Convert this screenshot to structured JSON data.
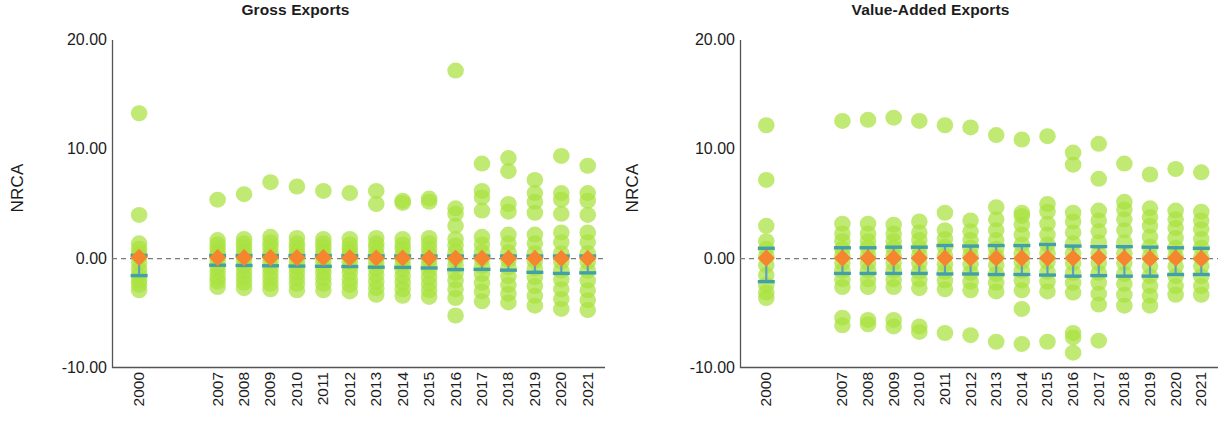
{
  "figure": {
    "width": 1230,
    "height": 434,
    "background": "#ffffff"
  },
  "style": {
    "dot_color": "#a7e23f",
    "mean_color": "#f5852f",
    "error_color": "#5a9ec9",
    "error_cap_color": "#43a0a8",
    "zeroline_color": "#7a7a7a",
    "axis_color": "#555555",
    "text_color": "#1c1c1c"
  },
  "chart_data": [
    {
      "panel": "left",
      "type": "scatter",
      "title": "Gross Exports",
      "xlabel": "",
      "ylabel": "NRCA",
      "ylim": [
        -10,
        20
      ],
      "yticks": [
        20,
        10,
        0,
        -10
      ],
      "ytick_labels": [
        "20.00",
        "10.00",
        "0.00",
        "-10.00"
      ],
      "grid": false,
      "legend": "none",
      "zero_reference_line": 0.0,
      "categories": [
        "2000",
        "2007",
        "2008",
        "2009",
        "2010",
        "2011",
        "2012",
        "2013",
        "2014",
        "2015",
        "2016",
        "2017",
        "2018",
        "2019",
        "2020",
        "2021"
      ],
      "series": [
        {
          "name": "Mean NRCA",
          "marker": "diamond",
          "values": [
            0.12,
            0.1,
            0.1,
            0.1,
            0.1,
            0.1,
            0.08,
            0.06,
            0.06,
            0.05,
            0.04,
            0.03,
            0.02,
            0.02,
            0.02,
            0.02
          ]
        },
        {
          "name": "95% Confidence Interval",
          "marker": "errorbar",
          "lower": [
            -1.55,
            -0.6,
            -0.62,
            -0.65,
            -0.68,
            -0.7,
            -0.72,
            -0.78,
            -0.8,
            -0.85,
            -1.0,
            -0.98,
            -1.05,
            -1.25,
            -1.35,
            -1.3
          ],
          "upper": [
            0.3,
            0.28,
            0.28,
            0.28,
            0.28,
            0.28,
            0.26,
            0.25,
            0.24,
            0.24,
            0.24,
            0.24,
            0.24,
            0.24,
            0.24,
            0.24
          ]
        }
      ],
      "scatter_points": {
        "2000": [
          13.3,
          4.0,
          1.4,
          0.9,
          0.5,
          0.2,
          -0.4,
          -1.0,
          -1.5,
          -2.0,
          -2.4,
          -2.9
        ],
        "2007": [
          5.4,
          1.7,
          1.3,
          0.9,
          0.5,
          0.2,
          -0.2,
          -0.7,
          -1.2,
          -1.7,
          -2.1,
          -2.6
        ],
        "2008": [
          5.9,
          1.8,
          1.4,
          1.0,
          0.6,
          0.2,
          -0.2,
          -0.7,
          -1.2,
          -1.7,
          -2.2,
          -2.7
        ],
        "2009": [
          7.0,
          2.0,
          1.5,
          1.1,
          0.6,
          0.2,
          -0.3,
          -0.8,
          -1.3,
          -1.8,
          -2.3,
          -2.8
        ],
        "2010": [
          6.6,
          1.9,
          1.4,
          1.0,
          0.6,
          0.2,
          -0.3,
          -0.8,
          -1.3,
          -1.8,
          -2.3,
          -2.9
        ],
        "2011": [
          6.2,
          1.8,
          1.4,
          1.0,
          0.6,
          0.2,
          -0.3,
          -0.8,
          -1.3,
          -1.8,
          -2.3,
          -2.9
        ],
        "2012": [
          6.0,
          1.8,
          1.3,
          0.9,
          0.5,
          0.2,
          -0.3,
          -0.8,
          -1.3,
          -1.9,
          -2.4,
          -3.0
        ],
        "2013": [
          6.2,
          5.0,
          1.9,
          1.4,
          1.0,
          0.5,
          0.1,
          -0.4,
          -0.9,
          -1.5,
          -2.1,
          -2.7,
          -3.3
        ],
        "2014": [
          5.3,
          5.1,
          1.8,
          1.3,
          0.9,
          0.4,
          0.0,
          -0.5,
          -1.0,
          -1.6,
          -2.2,
          -2.8,
          -3.4
        ],
        "2015": [
          5.5,
          5.2,
          1.9,
          1.4,
          0.9,
          0.4,
          -0.1,
          -0.6,
          -1.1,
          -1.7,
          -2.3,
          -2.9,
          -3.5
        ],
        "2016": [
          17.2,
          4.6,
          4.1,
          3.0,
          1.8,
          1.2,
          0.6,
          0.0,
          -0.6,
          -1.3,
          -2.0,
          -2.8,
          -3.6,
          -5.2
        ],
        "2017": [
          8.7,
          6.2,
          5.6,
          4.4,
          2.0,
          1.3,
          0.6,
          0.0,
          -0.7,
          -1.4,
          -2.2,
          -3.0,
          -3.9
        ],
        "2018": [
          9.2,
          8.0,
          5.0,
          4.3,
          2.2,
          1.4,
          0.6,
          -0.1,
          -0.8,
          -1.6,
          -2.4,
          -3.2,
          -4.0
        ],
        "2019": [
          7.2,
          6.0,
          5.2,
          4.2,
          2.2,
          1.4,
          0.5,
          -0.2,
          -0.9,
          -1.7,
          -2.5,
          -3.4,
          -4.3
        ],
        "2020": [
          9.4,
          6.0,
          5.4,
          4.1,
          2.4,
          1.5,
          0.5,
          -0.3,
          -1.1,
          -1.9,
          -2.8,
          -3.7,
          -4.6
        ],
        "2021": [
          8.5,
          6.0,
          5.3,
          4.0,
          2.4,
          1.5,
          0.5,
          -0.3,
          -1.1,
          -2.0,
          -2.9,
          -3.8,
          -4.7
        ]
      }
    },
    {
      "panel": "right",
      "type": "scatter",
      "title": "Value-Added Exports",
      "xlabel": "",
      "ylabel": "NRCA",
      "ylim": [
        -10,
        20
      ],
      "yticks": [
        20,
        10,
        0,
        -10
      ],
      "ytick_labels": [
        "20.00",
        "10.00",
        "0.00",
        "-10.00"
      ],
      "grid": false,
      "legend": "none",
      "zero_reference_line": 0.0,
      "categories": [
        "2000",
        "2007",
        "2008",
        "2009",
        "2010",
        "2011",
        "2012",
        "2013",
        "2014",
        "2015",
        "2016",
        "2017",
        "2018",
        "2019",
        "2020",
        "2021"
      ],
      "series": [
        {
          "name": "Mean NRCA",
          "marker": "diamond",
          "values": [
            0.05,
            0.05,
            0.05,
            0.05,
            0.05,
            0.05,
            0.05,
            0.05,
            0.05,
            0.05,
            0.05,
            0.1,
            0.05,
            0.0,
            0.05,
            0.0
          ]
        },
        {
          "name": "95% Confidence Interval",
          "marker": "errorbar",
          "lower": [
            -2.1,
            -1.35,
            -1.35,
            -1.35,
            -1.35,
            -1.4,
            -1.4,
            -1.45,
            -1.45,
            -1.5,
            -1.6,
            -1.55,
            -1.6,
            -1.6,
            -1.45,
            -1.45
          ],
          "upper": [
            0.95,
            1.0,
            1.0,
            1.05,
            1.05,
            1.2,
            1.15,
            1.2,
            1.2,
            1.3,
            1.15,
            1.1,
            1.1,
            1.05,
            1.0,
            0.95
          ]
        }
      ],
      "scatter_points": {
        "2000": [
          12.2,
          7.2,
          3.0,
          1.6,
          0.9,
          0.2,
          -0.6,
          -1.5,
          -2.4,
          -3.1,
          -3.6
        ],
        "2007": [
          12.6,
          3.2,
          2.3,
          1.6,
          0.9,
          0.3,
          -0.4,
          -1.1,
          -1.9,
          -2.6,
          -5.4,
          -6.1
        ],
        "2008": [
          12.7,
          3.2,
          2.3,
          1.6,
          1.0,
          0.3,
          -0.4,
          -1.1,
          -1.9,
          -2.6,
          -5.6,
          -6.0
        ],
        "2009": [
          12.9,
          3.1,
          2.3,
          1.6,
          1.0,
          0.3,
          -0.4,
          -1.1,
          -1.9,
          -2.6,
          -5.6,
          -6.2
        ],
        "2010": [
          12.6,
          3.4,
          2.4,
          1.7,
          1.0,
          0.3,
          -0.4,
          -1.2,
          -1.9,
          -2.7,
          -6.2,
          -6.7
        ],
        "2011": [
          12.2,
          4.2,
          2.6,
          1.8,
          1.1,
          0.3,
          -0.5,
          -1.2,
          -2.0,
          -2.8,
          -6.8
        ],
        "2012": [
          12.0,
          3.5,
          2.5,
          1.7,
          1.0,
          0.3,
          -0.5,
          -1.3,
          -2.1,
          -2.9,
          -7.0
        ],
        "2013": [
          11.3,
          4.7,
          3.6,
          2.6,
          1.7,
          0.9,
          0.2,
          -0.6,
          -1.4,
          -2.2,
          -3.0,
          -7.6
        ],
        "2014": [
          10.9,
          4.2,
          3.9,
          3.1,
          2.2,
          1.3,
          0.5,
          -0.3,
          -1.1,
          -2.0,
          -2.9,
          -4.6,
          -7.8
        ],
        "2015": [
          11.2,
          5.0,
          4.3,
          3.2,
          2.2,
          1.3,
          0.5,
          -0.3,
          -1.2,
          -2.1,
          -3.0,
          -7.6
        ],
        "2016": [
          9.7,
          8.6,
          4.2,
          3.4,
          2.4,
          1.4,
          0.5,
          -0.4,
          -1.3,
          -2.2,
          -3.1,
          -6.8,
          -7.2,
          -8.6
        ],
        "2017": [
          10.5,
          7.3,
          4.4,
          3.5,
          2.5,
          1.5,
          0.5,
          -0.4,
          -1.3,
          -2.2,
          -3.2,
          -4.2,
          -7.5
        ],
        "2018": [
          8.7,
          5.2,
          4.5,
          3.6,
          2.6,
          1.5,
          0.5,
          -0.4,
          -1.4,
          -2.3,
          -3.3,
          -4.3
        ],
        "2019": [
          7.7,
          4.6,
          3.8,
          3.0,
          2.0,
          1.1,
          0.2,
          -0.7,
          -1.6,
          -2.5,
          -3.4,
          -4.3
        ],
        "2020": [
          8.2,
          4.4,
          3.6,
          2.8,
          1.9,
          1.0,
          0.2,
          -0.7,
          -1.6,
          -2.5,
          -3.3
        ],
        "2021": [
          7.9,
          4.3,
          3.5,
          2.7,
          1.8,
          1.0,
          0.1,
          -0.7,
          -1.6,
          -2.5,
          -3.3
        ]
      }
    }
  ]
}
